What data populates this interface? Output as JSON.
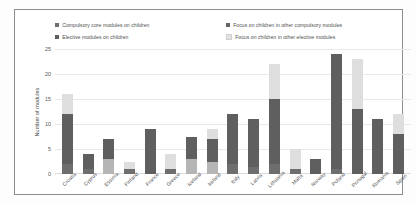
{
  "chart_data": {
    "type": "bar",
    "stacked": true,
    "title": "",
    "xlabel": "",
    "ylabel": "Number of modules",
    "ylim": [
      0,
      25
    ],
    "yticks": [
      0,
      5,
      10,
      15,
      20,
      25
    ],
    "grid": true,
    "legend_position": "top",
    "categories": [
      "Croatia",
      "Cyprus",
      "Estonia",
      "Finland",
      "France",
      "Greece",
      "Iceland",
      "Ireland",
      "Italy",
      "Latvia",
      "Lithuania",
      "Malta",
      "Norway",
      "Poland",
      "Portugal",
      "Romania",
      "Spain"
    ],
    "series": [
      {
        "name": "Compulsory core modules on children",
        "color": "#6e6e6e",
        "values": [
          2,
          1,
          0,
          1,
          0,
          1,
          0,
          0,
          2,
          1.5,
          2,
          1,
          0,
          1,
          0,
          0,
          0
        ]
      },
      {
        "name": "Elective modules on children",
        "color": "#b5b5b5",
        "values": [
          0,
          0,
          3,
          0,
          0,
          0,
          3,
          2.5,
          0,
          0,
          0,
          0,
          0,
          0,
          0,
          0,
          0
        ]
      },
      {
        "name": "Focus on children in other compulsory modules",
        "color": "#5f5f5f",
        "values": [
          10,
          3,
          4,
          0,
          9,
          0,
          4.5,
          4.5,
          10,
          9.5,
          13,
          0,
          3,
          23,
          13,
          11,
          8
        ]
      },
      {
        "name": "Focus on children in other elective modules",
        "color": "#dedede",
        "values": [
          4,
          0,
          0,
          1.5,
          0,
          3,
          0,
          2,
          0,
          0,
          7,
          4,
          0,
          0,
          10,
          0,
          4
        ]
      }
    ],
    "totals": [
      16,
      4,
      7,
      2.5,
      9,
      4,
      7.5,
      9,
      12,
      11,
      22,
      5,
      3,
      24,
      23,
      11,
      12
    ]
  },
  "legend": {
    "items": [
      {
        "label": "Compulsory core modules on children",
        "swatch": "legend-swatch-compulsory-core"
      },
      {
        "label": "Elective modules on children",
        "swatch": "legend-swatch-elective"
      },
      {
        "label": "Focus on children in other compulsory modules",
        "swatch": "legend-swatch-focus-compulsory"
      },
      {
        "label": "Focus on children in other elective modules",
        "swatch": "legend-swatch-focus-elective"
      }
    ]
  }
}
